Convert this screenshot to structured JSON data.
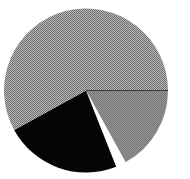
{
  "chart_data": {
    "type": "pie",
    "title": "",
    "start_direction": "east",
    "direction": "clockwise",
    "slices": [
      {
        "label": "",
        "value": 17,
        "color": "#8a8a8a",
        "pattern": "fine"
      },
      {
        "label": "",
        "value": 2,
        "color": "#ffffff",
        "pattern": "solid"
      },
      {
        "label": "",
        "value": 23,
        "color": "#050505",
        "pattern": "solid"
      },
      {
        "label": "",
        "value": 58,
        "color": "#9c9c9c",
        "pattern": "checker"
      }
    ],
    "legend": "none"
  }
}
